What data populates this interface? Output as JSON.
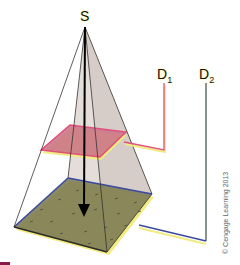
{
  "labels": {
    "source": "S",
    "d1_main": "D",
    "d1_sub": "1",
    "d2_main": "D",
    "d2_sub": "2"
  },
  "copyright": "© Cengage Learning 2013",
  "colors": {
    "pyramid_fill": "#c9b8b4",
    "near_plane_fill": "#d4708a",
    "near_plane_edge": "#e0507a",
    "far_plane_fill": "#7a7a50",
    "far_plane_edge_top": "#3a4aa0",
    "far_plane_edge_bottom": "#2a2a2a",
    "d1_line": "#e0507a",
    "d2_line_vertical": "#4a5a50",
    "d2_line_bottom": "#3a4aa0",
    "highlight": "#f2ec80",
    "accent_bar": "#8a1a4a"
  }
}
